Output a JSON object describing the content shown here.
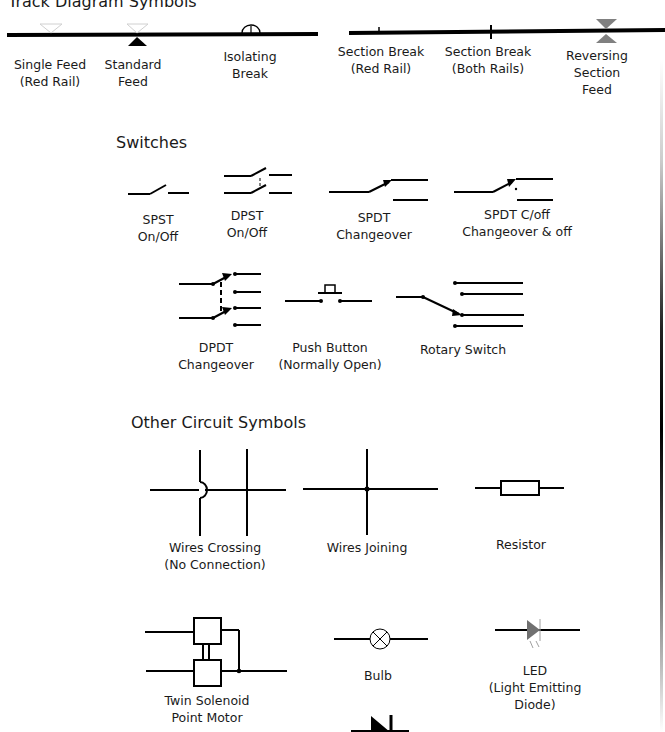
{
  "sections": {
    "track": {
      "title": "Track Diagram Symbols",
      "items": [
        {
          "name": "single-feed",
          "label": "Single Feed\n(Red Rail)"
        },
        {
          "name": "standard-feed",
          "label": "Standard\nFeed"
        },
        {
          "name": "isolating-break",
          "label": "Isolating\nBreak"
        },
        {
          "name": "section-break-red",
          "label": "Section Break\n(Red Rail)"
        },
        {
          "name": "section-break-both",
          "label": "Section Break\n(Both Rails)"
        },
        {
          "name": "reversing-section-feed",
          "label": "Reversing Section\nFeed"
        }
      ]
    },
    "switches": {
      "title": "Switches",
      "items": [
        {
          "name": "spst",
          "label": "SPST\nOn/Off"
        },
        {
          "name": "dpst",
          "label": "DPST\nOn/Off"
        },
        {
          "name": "spdt",
          "label": "SPDT\nChangeover"
        },
        {
          "name": "spdt-coff",
          "label": "SPDT C/off\nChangeover & off"
        },
        {
          "name": "dpdt",
          "label": "DPDT\nChangeover"
        },
        {
          "name": "push-button",
          "label": "Push Button\n(Normally Open)"
        },
        {
          "name": "rotary-switch",
          "label": "Rotary Switch"
        }
      ]
    },
    "other": {
      "title": "Other Circuit Symbols",
      "items": [
        {
          "name": "wires-crossing",
          "label": "Wires Crossing\n(No Connection)"
        },
        {
          "name": "wires-joining",
          "label": "Wires Joining"
        },
        {
          "name": "resistor",
          "label": "Resistor"
        },
        {
          "name": "twin-solenoid",
          "label": "Twin Solenoid\nPoint Motor"
        },
        {
          "name": "bulb",
          "label": "Bulb"
        },
        {
          "name": "led",
          "label": "LED\n(Light Emitting\nDiode)"
        }
      ]
    }
  },
  "colors": {
    "line": "#000000",
    "feed_ghost": "#d8d8d8",
    "reversing_feed": "#808080",
    "led": "#707070"
  }
}
